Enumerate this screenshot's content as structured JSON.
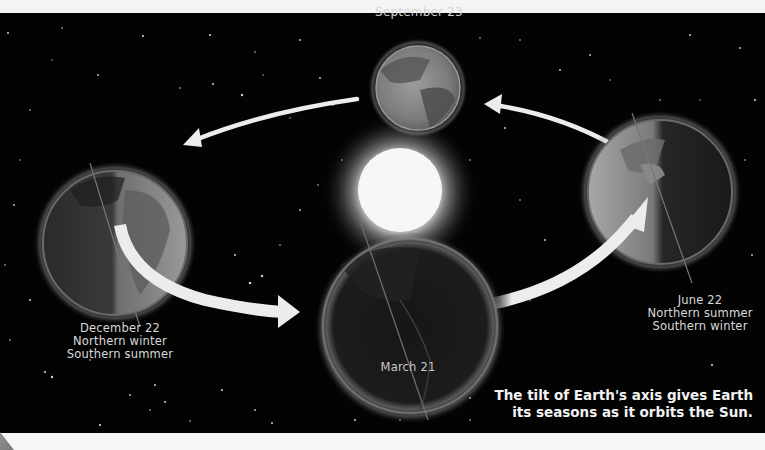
{
  "diagram": {
    "positions": [
      {
        "id": "september",
        "date": "September 23",
        "lines": []
      },
      {
        "id": "december",
        "date": "December 22",
        "lines": [
          "Northern winter",
          "Southern summer"
        ]
      },
      {
        "id": "june",
        "date": "June 22",
        "lines": [
          "Northern summer",
          "Southern winter"
        ]
      },
      {
        "id": "march",
        "date": "March 21",
        "lines": []
      }
    ],
    "center_body": "Sun",
    "caption": {
      "line1": "The tilt of Earth's axis gives Earth",
      "line2": "its seasons as it orbits the Sun."
    },
    "colors": {
      "space": "#030303",
      "label_text": "#d9d9d9",
      "caption_text": "#f2f2f2",
      "arrow": "#ededed",
      "sun": "#ffffff"
    }
  }
}
